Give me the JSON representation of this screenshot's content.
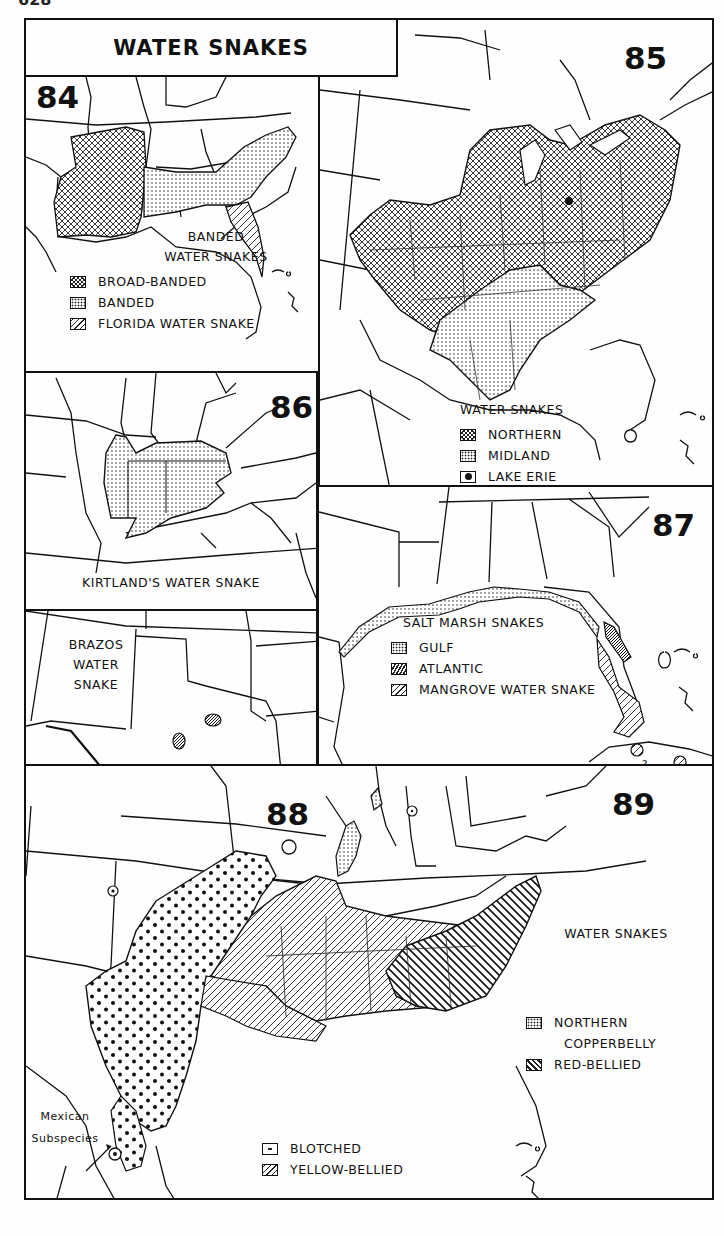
{
  "page": {
    "number": "628",
    "title": "WATER SNAKES"
  },
  "colors": {
    "ink": "#111111",
    "paper": "#fefefe"
  },
  "maps": [
    {
      "id": "84",
      "number": "84",
      "caption": [
        "BANDED",
        "WATER SNAKES"
      ],
      "legend": [
        {
          "pattern": "cross-hatch",
          "label": "BROAD-BANDED"
        },
        {
          "pattern": "fine-dots",
          "label": "BANDED"
        },
        {
          "pattern": "diagonal-lines",
          "label": "FLORIDA WATER SNAKE"
        }
      ]
    },
    {
      "id": "85",
      "number": "85",
      "caption": [
        "WATER SNAKES"
      ],
      "legend": [
        {
          "pattern": "cross-hatch",
          "label": "NORTHERN"
        },
        {
          "pattern": "fine-dots",
          "label": "MIDLAND"
        },
        {
          "pattern": "filled-circle",
          "label": "LAKE ERIE"
        }
      ]
    },
    {
      "id": "86",
      "number": "86",
      "caption": [
        "KIRTLAND'S WATER SNAKE"
      ],
      "legend": []
    },
    {
      "id": "87",
      "number": "87",
      "caption": [
        "SALT MARSH SNAKES"
      ],
      "legend": [
        {
          "pattern": "fine-dots",
          "label": "GULF"
        },
        {
          "pattern": "dense-lines",
          "label": "ATLANTIC"
        },
        {
          "pattern": "diagonal-lines",
          "label": "MANGROVE WATER SNAKE"
        }
      ],
      "annotation": "?"
    },
    {
      "id": "88",
      "number": "88",
      "caption": [
        "BRAZOS",
        "WATER",
        "SNAKE"
      ],
      "legend": []
    },
    {
      "id": "89",
      "number": "89",
      "caption": [
        "WATER SNAKES"
      ],
      "legend": [
        {
          "pattern": "fine-dots",
          "label": "NORTHERN",
          "label2": "COPPERBELLY"
        },
        {
          "pattern": "reverse-diagonal",
          "label": "RED-BELLIED"
        },
        {
          "pattern": "large-dots",
          "label": "BLOTCHED"
        },
        {
          "pattern": "diagonal-lines",
          "label": "YELLOW-BELLIED"
        }
      ],
      "annotation": [
        "Mexican",
        "Subspecies"
      ]
    }
  ]
}
